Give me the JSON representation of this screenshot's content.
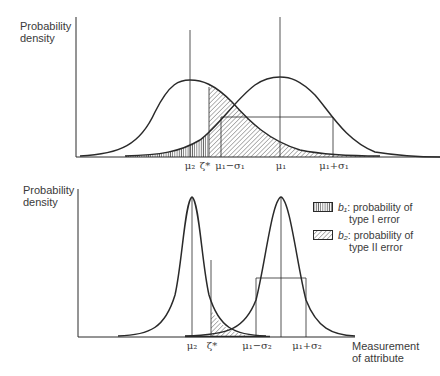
{
  "top_panel": {
    "ylabel_line1": "Probability",
    "ylabel_line2": "density",
    "ticks": {
      "mu2": "μ₂",
      "zeta": "ζ*",
      "mu1_minus_sigma": "μ₁−σ₁",
      "mu1": "μ₁",
      "mu1_plus_sigma": "μ₁+σ₁"
    }
  },
  "bottom_panel": {
    "ylabel_line1": "Probability",
    "ylabel_line2": "density",
    "xlabel_line1": "Measurement",
    "xlabel_line2": "of attribute",
    "ticks": {
      "mu2": "μ₂",
      "zeta": "ζ*",
      "mu1_minus_sigma": "μ₁−σ₂",
      "mu1_plus_sigma": "μ₁+σ₂"
    }
  },
  "legend": {
    "b1_symbol": "b₁",
    "b1_line1": ": probability of",
    "b1_line2": "type I error",
    "b2_symbol": "b₂",
    "b2_line1": ": probability of",
    "b2_line2": "type II error"
  },
  "colors": {
    "ink": "#2a2a2a",
    "background": "#ffffff"
  }
}
